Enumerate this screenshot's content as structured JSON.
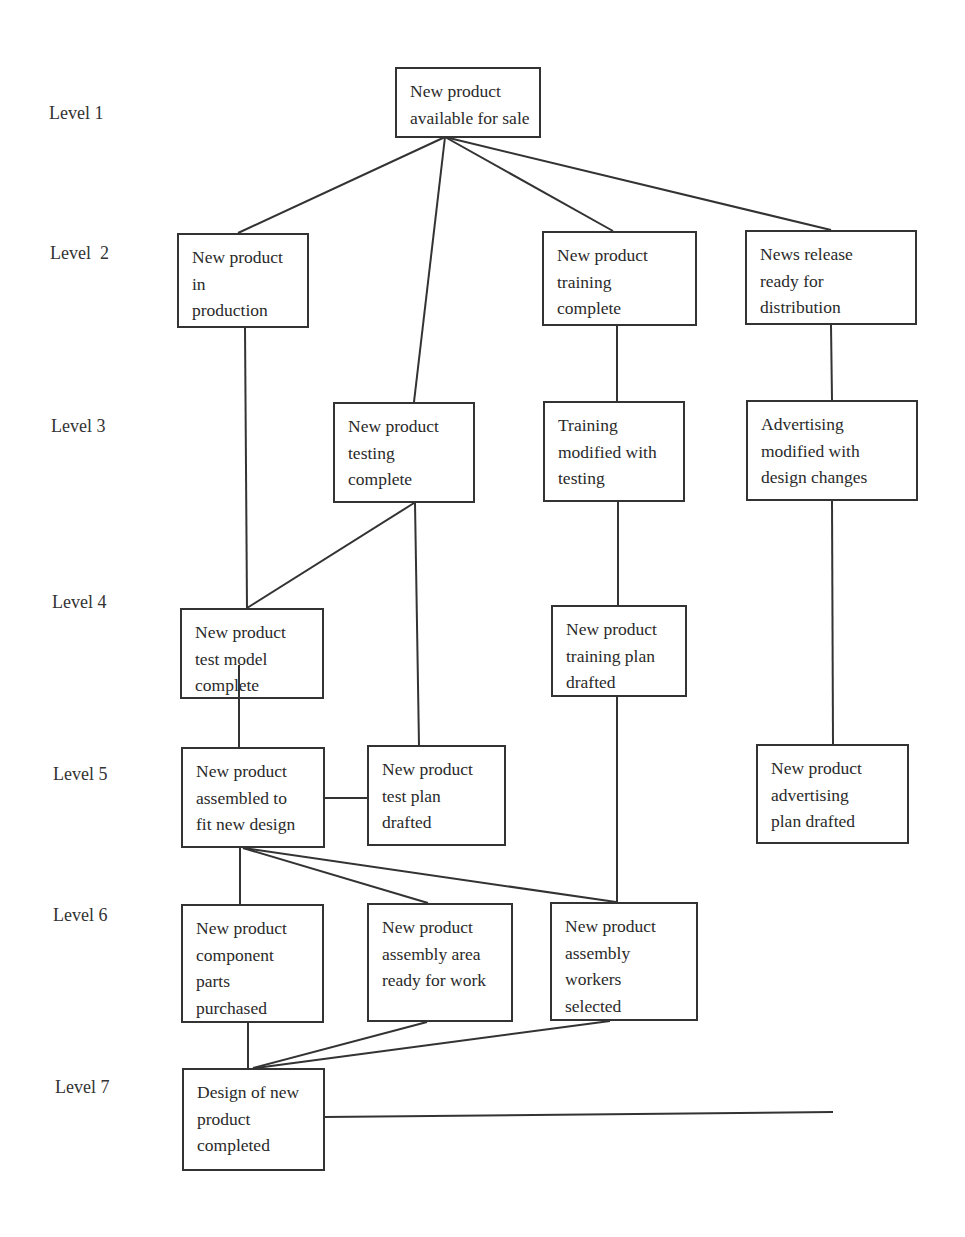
{
  "diagram": {
    "type": "work-breakdown hierarchy",
    "levels": [
      {
        "label": "Level 1",
        "x": 49,
        "y": 103
      },
      {
        "label": "Level  2",
        "x": 50,
        "y": 243
      },
      {
        "label": "Level 3",
        "x": 51,
        "y": 416
      },
      {
        "label": "Level 4",
        "x": 52,
        "y": 592
      },
      {
        "label": "Level 5",
        "x": 53,
        "y": 764
      },
      {
        "label": "Level 6",
        "x": 53,
        "y": 905
      },
      {
        "label": "Level 7",
        "x": 55,
        "y": 1077
      }
    ],
    "nodes": [
      {
        "id": "available",
        "level": 1,
        "lines": [
          "New product",
          "available for sale"
        ],
        "x": 395,
        "y": 67,
        "w": 146,
        "h": 71
      },
      {
        "id": "in-production",
        "level": 2,
        "lines": [
          "New product",
          "in",
          "production"
        ],
        "x": 177,
        "y": 233,
        "w": 132,
        "h": 95
      },
      {
        "id": "training-complete",
        "level": 2,
        "lines": [
          "New product",
          "training",
          "complete"
        ],
        "x": 542,
        "y": 231,
        "w": 155,
        "h": 95
      },
      {
        "id": "news-release",
        "level": 2,
        "lines": [
          "News release",
          "ready for",
          "distribution"
        ],
        "x": 745,
        "y": 230,
        "w": 172,
        "h": 95
      },
      {
        "id": "testing-complete",
        "level": 3,
        "lines": [
          "New product",
          "testing",
          "complete"
        ],
        "x": 333,
        "y": 402,
        "w": 142,
        "h": 101
      },
      {
        "id": "training-modified",
        "level": 3,
        "lines": [
          "Training",
          "modified with",
          "testing"
        ],
        "x": 543,
        "y": 401,
        "w": 142,
        "h": 101
      },
      {
        "id": "advertising-modified",
        "level": 3,
        "lines": [
          "Advertising",
          "modified with",
          "design changes"
        ],
        "x": 746,
        "y": 400,
        "w": 172,
        "h": 101
      },
      {
        "id": "test-model",
        "level": 4,
        "lines": [
          "New product",
          "test model",
          "complete"
        ],
        "x": 180,
        "y": 608,
        "w": 144,
        "h": 91
      },
      {
        "id": "training-plan",
        "level": 4,
        "lines": [
          "New product",
          "training plan",
          "drafted"
        ],
        "x": 551,
        "y": 605,
        "w": 136,
        "h": 92
      },
      {
        "id": "assembled",
        "level": 5,
        "lines": [
          "New product",
          "assembled to",
          "fit new design"
        ],
        "x": 181,
        "y": 747,
        "w": 144,
        "h": 101
      },
      {
        "id": "test-plan",
        "level": 5,
        "lines": [
          "New product",
          "test plan",
          "drafted"
        ],
        "x": 367,
        "y": 745,
        "w": 139,
        "h": 101
      },
      {
        "id": "advertising-plan",
        "level": 5,
        "lines": [
          "New product",
          "advertising",
          "plan drafted"
        ],
        "x": 756,
        "y": 744,
        "w": 153,
        "h": 100
      },
      {
        "id": "component-parts",
        "level": 6,
        "lines": [
          "New product",
          "component",
          "parts",
          "purchased"
        ],
        "x": 181,
        "y": 904,
        "w": 143,
        "h": 119
      },
      {
        "id": "assembly-area",
        "level": 6,
        "lines": [
          "New product",
          "assembly area",
          "ready for work"
        ],
        "x": 367,
        "y": 903,
        "w": 146,
        "h": 119
      },
      {
        "id": "assembly-workers",
        "level": 6,
        "lines": [
          "New product",
          "assembly",
          "workers",
          "selected"
        ],
        "x": 550,
        "y": 902,
        "w": 148,
        "h": 119
      },
      {
        "id": "design-completed",
        "level": 7,
        "lines": [
          "Design of new",
          "product",
          "completed"
        ],
        "x": 182,
        "y": 1068,
        "w": 143,
        "h": 103
      }
    ],
    "edges": [
      {
        "from": "available",
        "to": "in-production",
        "x1": 445,
        "y1": 137,
        "x2": 238,
        "y2": 233
      },
      {
        "from": "available",
        "to": "testing-complete",
        "x1": 445,
        "y1": 137,
        "x2": 414,
        "y2": 402
      },
      {
        "from": "available",
        "to": "training-complete",
        "x1": 445,
        "y1": 137,
        "x2": 613,
        "y2": 231
      },
      {
        "from": "available",
        "to": "news-release",
        "x1": 445,
        "y1": 137,
        "x2": 831,
        "y2": 230
      },
      {
        "from": "in-production",
        "to": "test-model",
        "x1": 245,
        "y1": 328,
        "x2": 247,
        "y2": 608
      },
      {
        "from": "testing-complete",
        "to": "test-model",
        "x1": 414,
        "y1": 503,
        "x2": 247,
        "y2": 608
      },
      {
        "from": "testing-complete",
        "to": "test-plan",
        "x1": 415,
        "y1": 503,
        "x2": 419,
        "y2": 745
      },
      {
        "from": "training-complete",
        "to": "training-modified",
        "x1": 617,
        "y1": 326,
        "x2": 617,
        "y2": 401
      },
      {
        "from": "news-release",
        "to": "advertising-modified",
        "x1": 831,
        "y1": 325,
        "x2": 832,
        "y2": 400
      },
      {
        "from": "training-modified",
        "to": "training-plan",
        "x1": 618,
        "y1": 502,
        "x2": 618,
        "y2": 605
      },
      {
        "from": "advertising-modified",
        "to": "advertising-plan",
        "x1": 832,
        "y1": 501,
        "x2": 833,
        "y2": 744
      },
      {
        "from": "test-model",
        "to": "assembled",
        "x1": 239,
        "y1": 665,
        "x2": 239,
        "y2": 747
      },
      {
        "from": "assembled",
        "to": "test-plan",
        "x1": 325,
        "y1": 798,
        "x2": 367,
        "y2": 798
      },
      {
        "from": "assembled",
        "to": "component-parts",
        "x1": 240,
        "y1": 848,
        "x2": 240,
        "y2": 904
      },
      {
        "from": "assembled",
        "to": "assembly-area",
        "x1": 243,
        "y1": 848,
        "x2": 428,
        "y2": 903
      },
      {
        "from": "assembled",
        "to": "assembly-workers",
        "x1": 243,
        "y1": 848,
        "x2": 616,
        "y2": 902
      },
      {
        "from": "training-plan",
        "to": "assembly-workers",
        "x1": 617,
        "y1": 697,
        "x2": 617,
        "y2": 902
      },
      {
        "from": "component-parts",
        "to": "design-completed",
        "x1": 248,
        "y1": 1023,
        "x2": 248,
        "y2": 1068
      },
      {
        "from": "assembly-area",
        "to": "design-completed",
        "x1": 427,
        "y1": 1022,
        "x2": 253,
        "y2": 1068
      },
      {
        "from": "assembly-workers",
        "to": "design-completed",
        "x1": 610,
        "y1": 1021,
        "x2": 256,
        "y2": 1068
      },
      {
        "from": "design-completed",
        "to": "open-end",
        "x1": 325,
        "y1": 1117,
        "x2": 833,
        "y2": 1112
      }
    ],
    "colors": {
      "line": "#333333",
      "text": "#2a2a2a",
      "background": "#ffffff"
    }
  }
}
